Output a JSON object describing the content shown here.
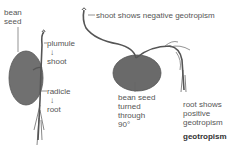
{
  "figure": {
    "title": "geotropism",
    "left_panel": {
      "labels": {
        "seed_line1": "bean",
        "seed_line2": "seed",
        "plumule": "plumule",
        "arrow1": "↓",
        "shoot": "shoot",
        "radicle": "radicle",
        "arrow2": "↓",
        "root": "root"
      }
    },
    "right_panel": {
      "labels": {
        "shoot_note": "shoot shows negative geotropism",
        "seed_line1": "bean seed",
        "seed_line2": "turned",
        "seed_line3": "through",
        "seed_line4": "90°",
        "root_line1": "root shows",
        "root_line2": "positive",
        "root_line3": "geotropism"
      }
    },
    "colors": {
      "seed": "#6f6f6f",
      "stem": "#555555",
      "text": "#555555"
    }
  }
}
